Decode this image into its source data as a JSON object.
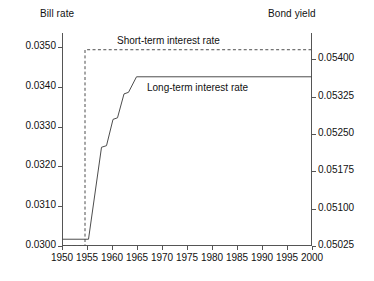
{
  "titles": {
    "left_axis": "Bill rate",
    "right_axis": "Bond yield"
  },
  "annotations": {
    "short_term": "Short-term interest rate",
    "long_term": "Long-term interest rate"
  },
  "chart_data": {
    "type": "line",
    "title": "",
    "subtitle": "",
    "xlabel": "",
    "ylabel": "Bill rate",
    "y2label": "Bond yield",
    "xlim": [
      1950,
      2000
    ],
    "ylim": [
      0.03,
      0.03535
    ],
    "y2lim": [
      0.05025,
      0.054525
    ],
    "grid": false,
    "legend_position": "inline-annotations",
    "xticks": [
      1950,
      1955,
      1960,
      1965,
      1970,
      1975,
      1980,
      1985,
      1990,
      1995,
      2000
    ],
    "xticklabels": [
      "1950",
      "1955",
      "1960",
      "1965",
      "1970",
      "1975",
      "1980",
      "1985",
      "1990",
      "1995",
      "2000"
    ],
    "yticks": [
      0.03,
      0.031,
      0.032,
      0.033,
      0.034,
      0.035
    ],
    "yticklabels": [
      "0.0300",
      "0.0310",
      "0.0320",
      "0.0330",
      "0.0340",
      "0.0350"
    ],
    "y2ticks": [
      0.05025,
      0.051,
      0.05175,
      0.0525,
      0.05325,
      0.054
    ],
    "y2ticklabels": [
      "0.05025",
      "0.05100",
      "0.05175",
      "0.05250",
      "0.05325",
      "0.05400"
    ],
    "series": [
      {
        "name": "Short-term interest rate",
        "axis": "left",
        "style": "dashed",
        "color": "#4d4d4d",
        "x": [
          1950,
          1954.6,
          1954.6,
          2000
        ],
        "values": [
          0.03,
          0.03,
          0.03493,
          0.03493
        ]
      },
      {
        "name": "Long-term interest rate",
        "axis": "left",
        "style": "solid",
        "color": "#4d4d4d",
        "x": [
          1950,
          1955.3,
          1957.9,
          1957.9,
          1958.9,
          1958.9,
          1960.2,
          1960.2,
          1961.1,
          1961.1,
          1962.4,
          1962.4,
          1963.3,
          1963.3,
          1964.9,
          2000
        ],
        "values": [
          0.03017,
          0.03017,
          0.03248,
          0.03248,
          0.03252,
          0.03252,
          0.03318,
          0.03318,
          0.03322,
          0.03322,
          0.03382,
          0.03382,
          0.03386,
          0.03386,
          0.03425,
          0.03425
        ]
      }
    ]
  }
}
